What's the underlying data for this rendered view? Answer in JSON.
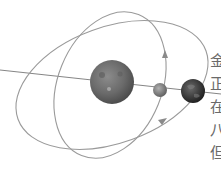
{
  "diagram": {
    "type": "orbital-alignment",
    "colors": {
      "orbit": "#9a9a9a",
      "axis_line": "#777777",
      "sun": "#6e6e6e",
      "venus": "#8a8a8a",
      "earth": "#3a3a3a",
      "text": "#6a6a6a"
    },
    "bodies": [
      {
        "name": "sun",
        "cx": 112,
        "cy": 82,
        "r": 22
      },
      {
        "name": "inner-planet",
        "cx": 160,
        "cy": 90,
        "r": 7
      },
      {
        "name": "earth",
        "cx": 193,
        "cy": 91,
        "r": 12
      }
    ],
    "orbits": [
      {
        "name": "inner-orbit",
        "direction": "counterclockwise"
      },
      {
        "name": "outer-orbit",
        "direction": "counterclockwise"
      }
    ]
  },
  "side_text": {
    "lines": [
      "金",
      "正",
      "在",
      "八",
      "但"
    ]
  }
}
